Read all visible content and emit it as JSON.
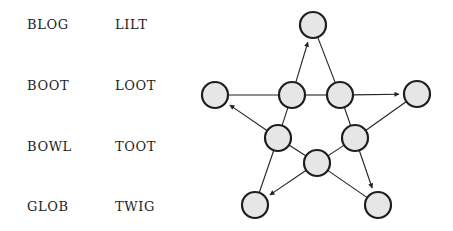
{
  "words": {
    "col1": [
      "BLOG",
      "BOOT",
      "BOWL",
      "GLOB"
    ],
    "col2": [
      "LILT",
      "LOOT",
      "TOOT",
      "TWIG"
    ]
  },
  "graph": {
    "node_fill": "#e6e6e6",
    "node_stroke": "#1e1e1e",
    "edge_color": "#222222",
    "node_radius": 13,
    "nodes": [
      {
        "id": "top",
        "x": 313,
        "y": 25
      },
      {
        "id": "left",
        "x": 215,
        "y": 95
      },
      {
        "id": "right",
        "x": 417,
        "y": 94
      },
      {
        "id": "bottom-left",
        "x": 255,
        "y": 205
      },
      {
        "id": "bottom-right",
        "x": 378,
        "y": 205
      },
      {
        "id": "inner-top-left",
        "x": 292,
        "y": 95
      },
      {
        "id": "inner-top-right",
        "x": 340,
        "y": 95
      },
      {
        "id": "inner-left",
        "x": 278,
        "y": 138
      },
      {
        "id": "inner-right",
        "x": 355,
        "y": 138
      },
      {
        "id": "inner-bottom",
        "x": 317,
        "y": 163
      }
    ],
    "edges": [
      {
        "from": "left",
        "to": "inner-top-left",
        "arrow": false
      },
      {
        "from": "inner-top-left",
        "to": "top",
        "arrow": true
      },
      {
        "from": "top",
        "to": "inner-top-right",
        "arrow": false
      },
      {
        "from": "inner-top-right",
        "to": "right",
        "arrow": true
      },
      {
        "from": "inner-top-left",
        "to": "inner-top-right",
        "arrow": false
      },
      {
        "from": "inner-top-left",
        "to": "inner-left",
        "arrow": false
      },
      {
        "from": "inner-left",
        "to": "left",
        "arrow": true
      },
      {
        "from": "inner-left",
        "to": "bottom-left",
        "arrow": false
      },
      {
        "from": "inner-left",
        "to": "inner-bottom",
        "arrow": false
      },
      {
        "from": "inner-bottom",
        "to": "bottom-left",
        "arrow": true
      },
      {
        "from": "inner-bottom",
        "to": "bottom-right",
        "arrow": false
      },
      {
        "from": "inner-bottom",
        "to": "inner-right",
        "arrow": false
      },
      {
        "from": "inner-right",
        "to": "right",
        "arrow": false
      },
      {
        "from": "inner-right",
        "to": "bottom-right",
        "arrow": true
      },
      {
        "from": "inner-top-right",
        "to": "inner-right",
        "arrow": false
      }
    ]
  }
}
